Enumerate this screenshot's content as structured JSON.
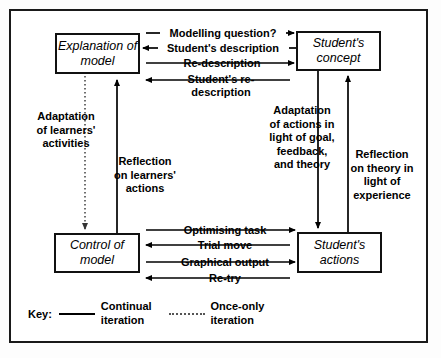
{
  "figure": {
    "background_color": "#ffffff",
    "line_color": "#000000",
    "dotted_line_color": "#555555"
  },
  "nodes": [
    {
      "id": "explanation-of-model",
      "label": "Explanation of\nmodel"
    },
    {
      "id": "students-concept",
      "label": "Student's\nconcept"
    },
    {
      "id": "control-of-model",
      "label": "Control of\nmodel"
    },
    {
      "id": "students-actions",
      "label": "Student's\nactions"
    }
  ],
  "edges": {
    "top": [
      {
        "label": "Modelling question?",
        "direction": "right",
        "style": "continual"
      },
      {
        "label": "Student's description",
        "direction": "left",
        "style": "continual"
      },
      {
        "label": "Re-description",
        "direction": "right",
        "style": "continual"
      },
      {
        "label": "Student's re-\ndescription",
        "direction": "left",
        "style": "continual"
      }
    ],
    "bottom": [
      {
        "label": "Optimising task",
        "direction": "right",
        "style": "continual"
      },
      {
        "label": "Trial move",
        "direction": "left",
        "style": "continual"
      },
      {
        "label": "Graphical output",
        "direction": "right",
        "style": "continual"
      },
      {
        "label": "Re-try",
        "direction": "left",
        "style": "continual"
      }
    ],
    "vertical": [
      {
        "label": "Adaptation\nof learners'\nactivities",
        "direction": "down",
        "style": "once-only"
      },
      {
        "label": "Reflection\non learners'\nactions",
        "direction": "up",
        "style": "continual"
      },
      {
        "label": "Adaptation\nof actions in\nlight of goal,\nfeedback,\nand theory",
        "direction": "down",
        "style": "continual"
      },
      {
        "label": "Reflection\non theory in\nlight of\nexperience",
        "direction": "up",
        "style": "continual"
      }
    ]
  },
  "labels": {
    "modelling_question": "Modelling question?",
    "students_description": "Student's description",
    "re_description": "Re-description",
    "students_re_description_l1": "Student's re-",
    "students_re_description_l2": "description",
    "optimising_task": "Optimising task",
    "trial_move": "Trial move",
    "graphical_output": "Graphical output",
    "re_try": "Re-try",
    "adaptation_learners_l1": "Adaptation",
    "adaptation_learners_l2": "of learners'",
    "adaptation_learners_l3": "activities",
    "reflection_learners_l1": "Reflection",
    "reflection_learners_l2": "on learners'",
    "reflection_learners_l3": "actions",
    "adaptation_actions_l1": "Adaptation",
    "adaptation_actions_l2": "of actions in",
    "adaptation_actions_l3": "light of goal,",
    "adaptation_actions_l4": "feedback,",
    "adaptation_actions_l5": "and theory",
    "reflection_theory_l1": "Reflection",
    "reflection_theory_l2": "on theory in",
    "reflection_theory_l3": "light of",
    "reflection_theory_l4": "experience"
  },
  "boxes": {
    "explanation_of_model_l1": "Explanation of",
    "explanation_of_model_l2": "model",
    "students_concept_l1": "Student's",
    "students_concept_l2": "concept",
    "control_of_model_l1": "Control of",
    "control_of_model_l2": "model",
    "students_actions_l1": "Student's",
    "students_actions_l2": "actions"
  },
  "legend": {
    "title": "Key:",
    "entries": [
      {
        "style": "solid",
        "line1": "Continual",
        "line2": "iteration"
      },
      {
        "style": "dotted",
        "line1": "Once-only",
        "line2": "iteration"
      }
    ],
    "continual_l1": "Continual",
    "continual_l2": "iteration",
    "once_only_l1": "Once-only",
    "once_only_l2": "iteration"
  }
}
